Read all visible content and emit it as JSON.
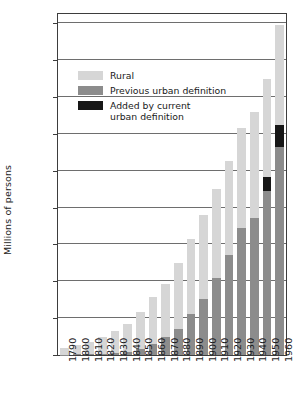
{
  "chart_data": {
    "type": "bar",
    "subtype": "stacked",
    "title": "",
    "xlabel": "",
    "ylabel": "Millions of persons",
    "ylim": [
      0,
      185
    ],
    "yticks": [
      0,
      20,
      40,
      60,
      80,
      100,
      120,
      140,
      160,
      180
    ],
    "ytick_labels": [
      "0",
      "20",
      "40",
      "60",
      "80",
      "100",
      "120",
      "140",
      "160",
      "180"
    ],
    "grid": "horizontal",
    "legend_position": "upper-left-inside",
    "categories": [
      "1790",
      "1800",
      "1810",
      "1820",
      "1830",
      "1840",
      "1850",
      "1860",
      "1870",
      "1880",
      "1890",
      "1900",
      "1910",
      "1920",
      "1930",
      "1940",
      "1950",
      "1960"
    ],
    "series": [
      {
        "name": "Previous urban definition",
        "color": "#8c8c8c",
        "values": [
          0.2,
          0.3,
          0.5,
          0.7,
          1.1,
          1.8,
          3.5,
          6.2,
          9.9,
          14.1,
          22.1,
          30.2,
          42.0,
          54.2,
          69.0,
          74.4,
          89.1,
          113.0
        ]
      },
      {
        "name": "Added by current urban definition",
        "color": "#171717",
        "values": [
          0,
          0,
          0,
          0,
          0,
          0,
          0,
          0,
          0,
          0,
          0,
          0,
          0,
          0,
          0,
          0,
          7.5,
          12.0
        ]
      },
      {
        "name": "Rural",
        "color": "#d6d6d6",
        "values": [
          3.7,
          4.9,
          6.7,
          8.9,
          11.7,
          15.2,
          19.6,
          25.2,
          28.6,
          36.0,
          40.8,
          45.8,
          48.0,
          51.0,
          54.0,
          57.3,
          53.3,
          54.0
        ]
      }
    ],
    "totals": [
      3.9,
      5.2,
      7.2,
      9.6,
      12.8,
      17.0,
      23.1,
      31.4,
      38.5,
      50.1,
      62.9,
      76.0,
      90.0,
      105.2,
      123.0,
      131.7,
      149.9,
      179.0
    ]
  },
  "legend": {
    "items": [
      {
        "label": "Rural",
        "swatch": "rural-swatch"
      },
      {
        "label": "Previous urban definition",
        "swatch": "previous-urban-swatch"
      },
      {
        "label": "Added by current\nurban definition",
        "swatch": "added-current-swatch"
      }
    ]
  },
  "axis": {
    "y_title": "Millions of persons"
  },
  "colors": {
    "rural": "#d6d6d6",
    "previous_urban": "#8c8c8c",
    "added_current": "#171717",
    "frame": "#3d3d3d",
    "gridline": "#6e6e6e",
    "background": "#ffffff"
  }
}
